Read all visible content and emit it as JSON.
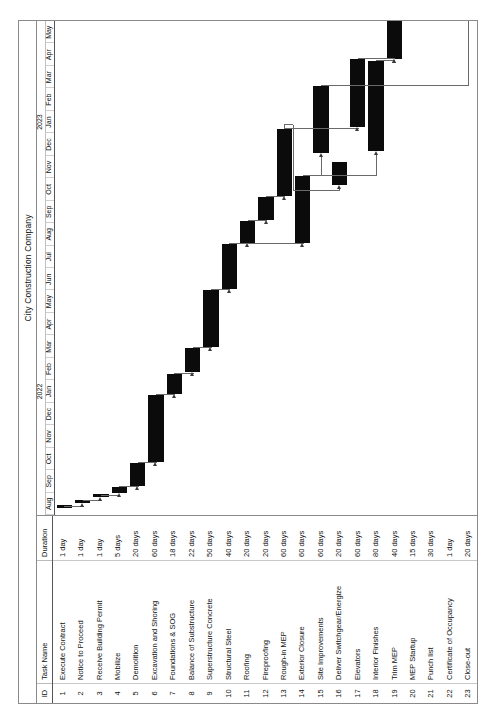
{
  "document": {
    "title": "City Construction Company",
    "orientation": "landscape-rotated"
  },
  "table": {
    "headers": {
      "id": "ID",
      "name": "Task Name",
      "duration": "Duration"
    }
  },
  "timescale": {
    "years": [
      {
        "label": "2022",
        "center_month_index": 5
      },
      {
        "label": "2023",
        "center_month_index": 17
      }
    ],
    "months": [
      "Aug",
      "Sep",
      "Oct",
      "Nov",
      "Dec",
      "Jan",
      "Feb",
      "Mar",
      "Apr",
      "May",
      "Jun",
      "Jul",
      "Aug",
      "Sep",
      "Oct",
      "Nov",
      "Dec",
      "Jan",
      "Feb",
      "Mar",
      "Apr",
      "May"
    ],
    "start": "Aug 2021",
    "end": "May 2023",
    "month_count": 22
  },
  "chart_data": {
    "type": "bar",
    "title": "City Construction Company",
    "xlabel": "",
    "ylabel": "",
    "categories": [
      "Execute Contract",
      "Notice to Proceed",
      "Receive Building Permit",
      "Mobilize",
      "Demolition",
      "Excavation and Shoring",
      "Foundations & SOG",
      "Balance of Substructure",
      "Superstructure Concrete",
      "Structural Steel",
      "Roofing",
      "Fireproofing",
      "Rough-in MEP",
      "Exterior Closure",
      "Site Improvements",
      "Deliver Switchgear/Energize",
      "Elevators",
      "Interior Finishes",
      "Trim MEP",
      "MEP Startup",
      "Punch list",
      "Certificate of Occupancy",
      "Close-out"
    ],
    "values": [
      1,
      1,
      1,
      5,
      20,
      60,
      18,
      22,
      50,
      40,
      20,
      20,
      60,
      60,
      60,
      20,
      60,
      80,
      40,
      15,
      30,
      1,
      20
    ],
    "unit": "days",
    "grid": false,
    "legend": "none"
  },
  "tasks": [
    {
      "id": "1",
      "name": "Execute Contract",
      "duration": "1 day",
      "start_m": 0.3,
      "len_m": 0.05
    },
    {
      "id": "2",
      "name": "Notice to Proceed",
      "duration": "1 day",
      "start_m": 0.55,
      "len_m": 0.05
    },
    {
      "id": "3",
      "name": "Receive Building Permit",
      "duration": "1 day",
      "start_m": 0.8,
      "len_m": 0.05
    },
    {
      "id": "4",
      "name": "Mobilize",
      "duration": "5 days",
      "start_m": 1.0,
      "len_m": 0.25
    },
    {
      "id": "5",
      "name": "Demolition",
      "duration": "20 days",
      "start_m": 1.3,
      "len_m": 1.0
    },
    {
      "id": "6",
      "name": "Excavation and Shoring",
      "duration": "60 days",
      "start_m": 2.35,
      "len_m": 3.0
    },
    {
      "id": "7",
      "name": "Foundations & SOG",
      "duration": "18 days",
      "start_m": 5.4,
      "len_m": 0.9
    },
    {
      "id": "8",
      "name": "Balance of Substructure",
      "duration": "22 days",
      "start_m": 6.35,
      "len_m": 1.1
    },
    {
      "id": "9",
      "name": "Superstructure Concrete",
      "duration": "50 days",
      "start_m": 7.5,
      "len_m": 2.5
    },
    {
      "id": "10",
      "name": "Structural Steel",
      "duration": "40 days",
      "start_m": 10.05,
      "len_m": 2.0
    },
    {
      "id": "11",
      "name": "Roofing",
      "duration": "20 days",
      "start_m": 12.1,
      "len_m": 1.0
    },
    {
      "id": "12",
      "name": "Fireproofing",
      "duration": "20 days",
      "start_m": 13.15,
      "len_m": 1.0
    },
    {
      "id": "13",
      "name": "Rough-in MEP",
      "duration": "60 days",
      "start_m": 14.2,
      "len_m": 3.0
    },
    {
      "id": "14",
      "name": "Exterior Closure",
      "duration": "60 days",
      "start_m": 12.1,
      "len_m": 3.0
    },
    {
      "id": "15",
      "name": "Site Improvements",
      "duration": "60 days",
      "start_m": 16.1,
      "len_m": 3.0
    },
    {
      "id": "16",
      "name": "Deliver Switchgear/Energize",
      "duration": "20 days",
      "start_m": 14.7,
      "len_m": 1.0
    },
    {
      "id": "17",
      "name": "Elevators",
      "duration": "60 days",
      "start_m": 17.3,
      "len_m": 3.0
    },
    {
      "id": "18",
      "name": "Interior Finishes",
      "duration": "80 days",
      "start_m": 16.2,
      "len_m": 4.0
    },
    {
      "id": "19",
      "name": "Trim MEP",
      "duration": "40 days",
      "start_m": 20.3,
      "len_m": 2.0
    },
    {
      "id": "20",
      "name": "MEP Startup",
      "duration": "15 days",
      "start_m": 22.4,
      "len_m": 0.75
    },
    {
      "id": "21",
      "name": "Punch list",
      "duration": "30 days",
      "start_m": 23.25,
      "len_m": 1.5
    },
    {
      "id": "22",
      "name": "Certificate of Occupancy",
      "duration": "1 day",
      "start_m": 24.85,
      "len_m": 0.06
    },
    {
      "id": "23",
      "name": "Close-out",
      "duration": "20 days",
      "start_m": 25.3,
      "len_m": 1.0
    }
  ],
  "links": [
    {
      "from": 0,
      "to": 1
    },
    {
      "from": 1,
      "to": 2
    },
    {
      "from": 2,
      "to": 3
    },
    {
      "from": 3,
      "to": 4
    },
    {
      "from": 4,
      "to": 5
    },
    {
      "from": 5,
      "to": 6
    },
    {
      "from": 6,
      "to": 7
    },
    {
      "from": 7,
      "to": 8
    },
    {
      "from": 8,
      "to": 9
    },
    {
      "from": 9,
      "to": 10
    },
    {
      "from": 10,
      "to": 11
    },
    {
      "from": 11,
      "to": 12
    },
    {
      "from": 9,
      "to": 13
    },
    {
      "from": 13,
      "to": 14
    },
    {
      "from": 12,
      "to": 15
    },
    {
      "from": 12,
      "to": 16
    },
    {
      "from": 13,
      "to": 17
    },
    {
      "from": 17,
      "to": 18
    },
    {
      "from": 16,
      "to": 18
    },
    {
      "from": 18,
      "to": 19
    },
    {
      "from": 19,
      "to": 20
    },
    {
      "from": 20,
      "to": 21
    },
    {
      "from": 21,
      "to": 22
    },
    {
      "from": 14,
      "to": 22
    }
  ]
}
